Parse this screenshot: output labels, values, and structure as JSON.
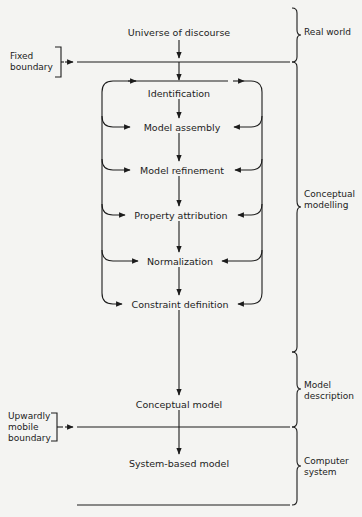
{
  "diagram": {
    "nodes": [
      {
        "id": "universe",
        "label": "Universe of discourse"
      },
      {
        "id": "identification",
        "label": "Identification"
      },
      {
        "id": "assembly",
        "label": "Model assembly"
      },
      {
        "id": "refinement",
        "label": "Model refinement"
      },
      {
        "id": "property",
        "label": "Property attribution"
      },
      {
        "id": "normalization",
        "label": "Normalization"
      },
      {
        "id": "constraint",
        "label": "Constraint definition"
      },
      {
        "id": "conceptual",
        "label": "Conceptual model"
      },
      {
        "id": "system",
        "label": "System-based model"
      }
    ],
    "boundaries": {
      "fixed": {
        "line1": "Fixed",
        "line2": "boundary"
      },
      "mobile": {
        "line1": "Upwardly",
        "line2": "mobile",
        "line3": "boundary"
      }
    },
    "regions": {
      "real_world": {
        "line1": "Real world"
      },
      "conceptual_modelling": {
        "line1": "Conceptual",
        "line2": "modelling"
      },
      "model_description": {
        "line1": "Model",
        "line2": "description"
      },
      "computer_system": {
        "line1": "Computer",
        "line2": "system"
      }
    },
    "colors": {
      "ink": "#1c1c1c",
      "paper": "#f4f4f2"
    }
  }
}
